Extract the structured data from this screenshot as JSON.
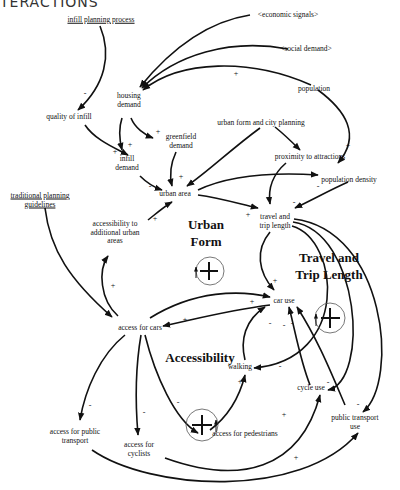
{
  "title": "TERACTIONS",
  "nodes": [
    {
      "id": "infill-planning-process",
      "label": "infill planning process",
      "exogenous": true
    },
    {
      "id": "economic-signals",
      "label": "<economic signals>"
    },
    {
      "id": "social-demand",
      "label": "<social demand>"
    },
    {
      "id": "population",
      "label": "population"
    },
    {
      "id": "housing-demand",
      "label": "housing demand"
    },
    {
      "id": "quality-of-infill",
      "label": "quality of infill"
    },
    {
      "id": "greenfield-demand",
      "label": "greenfield demand"
    },
    {
      "id": "urban-form-city-planning",
      "label": "urban form and city planning"
    },
    {
      "id": "infill-demand",
      "label": "infill demand"
    },
    {
      "id": "proximity-to-attractions",
      "label": "proximity to attractions"
    },
    {
      "id": "urban-area",
      "label": "urban area"
    },
    {
      "id": "population-density",
      "label": "population density"
    },
    {
      "id": "traditional-planning-guidelines",
      "label": "traditional planning guidelines",
      "exogenous": true
    },
    {
      "id": "accessibility-additional-urban-areas",
      "label": "accessibility to additional urban areas"
    },
    {
      "id": "travel-trip-length",
      "label": "travel and trip length"
    },
    {
      "id": "car-use",
      "label": "car use"
    },
    {
      "id": "access-for-cars",
      "label": "access for cars"
    },
    {
      "id": "walking",
      "label": "walking"
    },
    {
      "id": "cycle-use",
      "label": "cycle use"
    },
    {
      "id": "public-transport-use",
      "label": "public transport use"
    },
    {
      "id": "access-for-public-transport",
      "label": "access for public transport"
    },
    {
      "id": "access-for-cyclists",
      "label": "access for cyclists"
    },
    {
      "id": "access-for-pedestrians",
      "label": "access for pedestrians"
    }
  ],
  "loops": [
    {
      "id": "urban-form",
      "label": "Urban Form",
      "polarity": "+"
    },
    {
      "id": "travel-trip-length",
      "label": "Travel and Trip Length",
      "polarity": "+"
    },
    {
      "id": "accessibility",
      "label": "Accessibility",
      "polarity": "+"
    }
  ],
  "links": [
    {
      "from": "infill-planning-process",
      "to": "quality-of-infill",
      "polarity": "-"
    },
    {
      "from": "economic-signals",
      "to": "housing-demand",
      "polarity": ""
    },
    {
      "from": "social-demand",
      "to": "housing-demand",
      "polarity": ""
    },
    {
      "from": "population",
      "to": "housing-demand",
      "polarity": "+"
    },
    {
      "from": "population",
      "to": "population-density",
      "polarity": "+"
    },
    {
      "from": "quality-of-infill",
      "to": "infill-demand",
      "polarity": "+"
    },
    {
      "from": "housing-demand",
      "to": "infill-demand",
      "polarity": "+"
    },
    {
      "from": "housing-demand",
      "to": "greenfield-demand",
      "polarity": "+"
    },
    {
      "from": "greenfield-demand",
      "to": "urban-area",
      "polarity": "+"
    },
    {
      "from": "infill-demand",
      "to": "urban-area",
      "polarity": "-"
    },
    {
      "from": "urban-form-city-planning",
      "to": "urban-area",
      "polarity": ""
    },
    {
      "from": "urban-form-city-planning",
      "to": "proximity-to-attractions",
      "polarity": ""
    },
    {
      "from": "urban-area",
      "to": "population-density",
      "polarity": "-"
    },
    {
      "from": "urban-area",
      "to": "travel-trip-length",
      "polarity": "+"
    },
    {
      "from": "proximity-to-attractions",
      "to": "travel-trip-length",
      "polarity": ""
    },
    {
      "from": "population-density",
      "to": "travel-trip-length",
      "polarity": "-"
    },
    {
      "from": "accessibility-additional-urban-areas",
      "to": "urban-area",
      "polarity": "+"
    },
    {
      "from": "travel-trip-length",
      "to": "car-use",
      "polarity": "+"
    },
    {
      "from": "travel-trip-length",
      "to": "walking",
      "polarity": "-"
    },
    {
      "from": "travel-trip-length",
      "to": "cycle-use",
      "polarity": "-"
    },
    {
      "from": "travel-trip-length",
      "to": "public-transport-use",
      "polarity": "-"
    },
    {
      "from": "traditional-planning-guidelines",
      "to": "access-for-cars",
      "polarity": ""
    },
    {
      "from": "access-for-cars",
      "to": "accessibility-additional-urban-areas",
      "polarity": "+"
    },
    {
      "from": "access-for-cars",
      "to": "car-use",
      "polarity": "+"
    },
    {
      "from": "car-use",
      "to": "access-for-cars",
      "polarity": "+"
    },
    {
      "from": "access-for-cars",
      "to": "access-for-public-transport",
      "polarity": "-"
    },
    {
      "from": "access-for-cars",
      "to": "access-for-cyclists",
      "polarity": "-"
    },
    {
      "from": "access-for-cars",
      "to": "access-for-pedestrians",
      "polarity": "-"
    },
    {
      "from": "access-for-pedestrians",
      "to": "walking",
      "polarity": "+"
    },
    {
      "from": "walking",
      "to": "car-use",
      "polarity": "-"
    },
    {
      "from": "cycle-use",
      "to": "car-use",
      "polarity": "-"
    },
    {
      "from": "public-transport-use",
      "to": "car-use",
      "polarity": "-"
    },
    {
      "from": "access-for-cyclists",
      "to": "cycle-use",
      "polarity": "+"
    },
    {
      "from": "access-for-public-transport",
      "to": "public-transport-use",
      "polarity": "+"
    }
  ]
}
